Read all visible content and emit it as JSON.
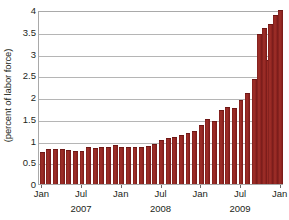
{
  "chart_data": {
    "type": "bar",
    "title": "",
    "subtitle": "",
    "xlabel": "",
    "ylabel": "(percent of labor force)",
    "ylim": [
      0,
      4
    ],
    "ytick_labels": [
      "0",
      "0.5",
      "1",
      "1.5",
      "2",
      "2.5",
      "3",
      "3.5",
      "4"
    ],
    "ytick_values": [
      0,
      0.5,
      1,
      1.5,
      2,
      2.5,
      3,
      3.5,
      4
    ],
    "grid": true,
    "legend": "none",
    "bar_color": "#8d2320",
    "axis_color": "#a9a9a9",
    "gridline_color": "#b5b5b5",
    "text_color": "#231f20",
    "categories": [
      "Jan 2007",
      "Feb 2007",
      "Mar 2007",
      "Apr 2007",
      "May 2007",
      "Jun 2007",
      "Jul 2007",
      "Aug 2007",
      "Sep 2007",
      "Oct 2007",
      "Nov 2007",
      "Dec 2007",
      "Jan 2008",
      "Feb 2008",
      "Mar 2008",
      "Apr 2008",
      "May 2008",
      "Jun 2008",
      "Jul 2008",
      "Aug 2008",
      "Sep 2008",
      "Oct 2008",
      "Nov 2008",
      "Dec 2008",
      "Jan 2009",
      "Feb 2009",
      "Mar 2009",
      "Apr 2009",
      "May 2009",
      "Jun 2009",
      "Jul 2009",
      "Aug 2009",
      "Sep 2009",
      "Oct 2009",
      "Nov 2009",
      "Dec 2009",
      "Jan 2010"
    ],
    "values": [
      0.73,
      0.8,
      0.8,
      0.8,
      0.79,
      0.75,
      0.77,
      0.86,
      0.83,
      0.84,
      0.85,
      0.89,
      0.86,
      0.86,
      0.86,
      0.86,
      0.87,
      0.91,
      1.02,
      1.05,
      1.07,
      1.13,
      1.17,
      1.23,
      1.35,
      1.5,
      1.46,
      1.71,
      1.76,
      1.74,
      1.92,
      2.1,
      2.41,
      2.58,
      2.86,
      3.25,
      4.01
    ],
    "xticks": [
      {
        "label": "Jan",
        "index": 0
      },
      {
        "label": "Jul",
        "index": 6
      },
      {
        "label": "Jan",
        "index": 12
      },
      {
        "label": "Jul",
        "index": 18
      },
      {
        "label": "Jan",
        "index": 24
      },
      {
        "label": "Jul",
        "index": 30
      },
      {
        "label": "Jan",
        "index": 36
      }
    ],
    "year_labels": [
      {
        "label": "2007",
        "index": 6
      },
      {
        "label": "2008",
        "index": 18
      },
      {
        "label": "2009",
        "index": 30
      }
    ],
    "extra_bars": [
      {
        "index": 36,
        "value": 3.45
      },
      {
        "index": 36,
        "value": 3.58
      },
      {
        "index": 36,
        "value": 3.69
      },
      {
        "index": 36,
        "value": 3.89
      }
    ]
  }
}
